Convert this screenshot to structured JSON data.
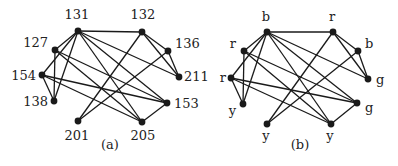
{
  "figure": {
    "panels": [
      {
        "caption": "(a)",
        "caption_pos": [
          110,
          149
        ],
        "nodes": [
          {
            "id": "131",
            "label": "131",
            "x": 78,
            "y": 31,
            "lx": 77,
            "ly": 19,
            "anchor": "middle"
          },
          {
            "id": "132",
            "label": "132",
            "x": 142,
            "y": 32,
            "lx": 143,
            "ly": 19,
            "anchor": "middle"
          },
          {
            "id": "127",
            "label": "127",
            "x": 55,
            "y": 50,
            "lx": 48,
            "ly": 47,
            "anchor": "end"
          },
          {
            "id": "136",
            "label": "136",
            "x": 168,
            "y": 51,
            "lx": 175,
            "ly": 48,
            "anchor": "start"
          },
          {
            "id": "154",
            "label": "154",
            "x": 42,
            "y": 75,
            "lx": 36,
            "ly": 80,
            "anchor": "end"
          },
          {
            "id": "211",
            "label": "211",
            "x": 179,
            "y": 77,
            "lx": 184,
            "ly": 81,
            "anchor": "start"
          },
          {
            "id": "138",
            "label": "138",
            "x": 54,
            "y": 101,
            "lx": 48,
            "ly": 106,
            "anchor": "end"
          },
          {
            "id": "153",
            "label": "153",
            "x": 167,
            "y": 103,
            "lx": 174,
            "ly": 108,
            "anchor": "start"
          },
          {
            "id": "201",
            "label": "201",
            "x": 78,
            "y": 121,
            "lx": 77,
            "ly": 140,
            "anchor": "middle"
          },
          {
            "id": "205",
            "label": "205",
            "x": 142,
            "y": 122,
            "lx": 143,
            "ly": 140,
            "anchor": "middle"
          }
        ]
      },
      {
        "caption": "(b)",
        "caption_pos": [
          300,
          149
        ],
        "nodes": [
          {
            "id": "131",
            "label": "b",
            "x": 267,
            "y": 32,
            "lx": 266,
            "ly": 21,
            "anchor": "middle"
          },
          {
            "id": "132",
            "label": "r",
            "x": 333,
            "y": 32,
            "lx": 332,
            "ly": 21,
            "anchor": "middle"
          },
          {
            "id": "127",
            "label": "r",
            "x": 244,
            "y": 51,
            "lx": 236,
            "ly": 48,
            "anchor": "end"
          },
          {
            "id": "136",
            "label": "b",
            "x": 358,
            "y": 51,
            "lx": 365,
            "ly": 48,
            "anchor": "start"
          },
          {
            "id": "154",
            "label": "r",
            "x": 231,
            "y": 78,
            "lx": 226,
            "ly": 82,
            "anchor": "end"
          },
          {
            "id": "211",
            "label": "g",
            "x": 368,
            "y": 79,
            "lx": 376,
            "ly": 84,
            "anchor": "start"
          },
          {
            "id": "138",
            "label": "y",
            "x": 243,
            "y": 104,
            "lx": 236,
            "ly": 115,
            "anchor": "end"
          },
          {
            "id": "153",
            "label": "g",
            "x": 357,
            "y": 103,
            "lx": 365,
            "ly": 112,
            "anchor": "start"
          },
          {
            "id": "201",
            "label": "y",
            "x": 267,
            "y": 124,
            "lx": 266,
            "ly": 140,
            "anchor": "middle"
          },
          {
            "id": "205",
            "label": "y",
            "x": 331,
            "y": 124,
            "lx": 330,
            "ly": 140,
            "anchor": "middle"
          }
        ]
      }
    ],
    "edges": [
      [
        "131",
        "132"
      ],
      [
        "131",
        "127"
      ],
      [
        "131",
        "154"
      ],
      [
        "131",
        "138"
      ],
      [
        "131",
        "211"
      ],
      [
        "131",
        "153"
      ],
      [
        "131",
        "205"
      ],
      [
        "132",
        "136"
      ],
      [
        "132",
        "211"
      ],
      [
        "132",
        "201"
      ],
      [
        "136",
        "211"
      ],
      [
        "136",
        "201"
      ],
      [
        "127",
        "138"
      ],
      [
        "127",
        "153"
      ],
      [
        "127",
        "205"
      ],
      [
        "154",
        "138"
      ],
      [
        "154",
        "153"
      ],
      [
        "154",
        "205"
      ],
      [
        "153",
        "205"
      ]
    ]
  }
}
